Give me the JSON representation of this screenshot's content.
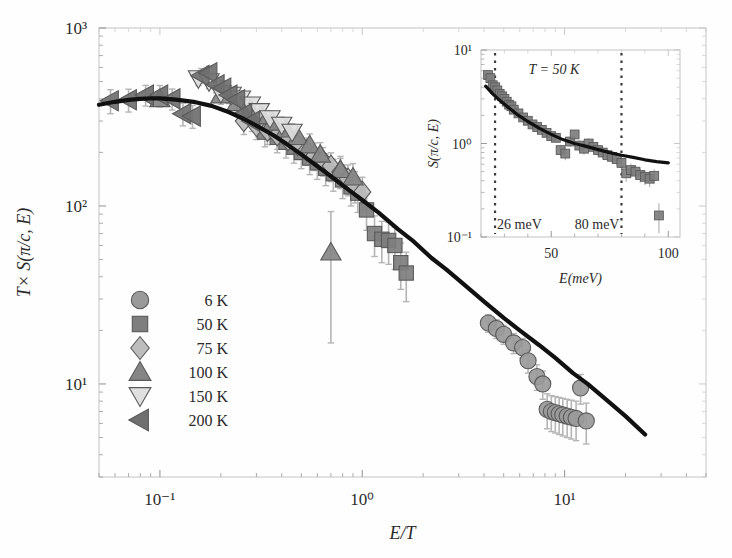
{
  "figure": {
    "background": "#fefefe",
    "frame_color": "#c8c8c8",
    "curve_color": "#111111",
    "marker_fill": "#8f8f8f",
    "marker_edge": "#5a5a5a",
    "marker_fill_light": "#cfcfcf",
    "errorbar_color": "#b5b5b5"
  },
  "chart_data": {
    "type": "scatter",
    "title": "",
    "xlabel": "E/T",
    "ylabel": "T× S(π/c, E)",
    "xscale": "log",
    "yscale": "log",
    "xlim": [
      0.05,
      50
    ],
    "ylim": [
      3,
      1000
    ],
    "xticks": [
      0.1,
      1,
      10
    ],
    "xticklabels": [
      "10⁻¹",
      "10⁰",
      "10¹"
    ],
    "yticks": [
      10,
      100,
      1000
    ],
    "yticklabels": [
      "10¹",
      "10²",
      "10³"
    ],
    "grid": false,
    "legend_position": "lower-left",
    "legend": [
      {
        "label": "6 K",
        "marker": "circle",
        "fill": "#9a9a9a"
      },
      {
        "label": "50 K",
        "marker": "square",
        "fill": "#7e7e7e"
      },
      {
        "label": "75 K",
        "marker": "diamond",
        "fill": "#bdbdbd"
      },
      {
        "label": "100 K",
        "marker": "triangle-up",
        "fill": "#858585"
      },
      {
        "label": "150 K",
        "marker": "triangle-down",
        "fill": "#e0e0e0"
      },
      {
        "label": "200 K",
        "marker": "triangle-left",
        "fill": "#6f6f6f"
      }
    ],
    "fit_curve": {
      "name": "scaling function fit",
      "x": [
        0.05,
        0.06,
        0.07,
        0.08,
        0.09,
        0.1,
        0.12,
        0.15,
        0.18,
        0.22,
        0.26,
        0.3,
        0.36,
        0.42,
        0.5,
        0.6,
        0.7,
        0.85,
        1.0,
        1.2,
        1.5,
        1.8,
        2.2,
        2.6,
        3.2,
        4.0,
        5.0,
        6.0,
        7.5,
        9.0,
        11.0,
        13.0,
        16.0,
        20.0,
        25.0
      ],
      "y": [
        370,
        385,
        395,
        400,
        402,
        402,
        396,
        383,
        365,
        336,
        308,
        283,
        251,
        224,
        195,
        167,
        147,
        124,
        108,
        92,
        74,
        63,
        51,
        44,
        36,
        29,
        23.5,
        20,
        16.5,
        14,
        11.5,
        10,
        8.2,
        6.6,
        5.2
      ]
    },
    "series": [
      {
        "name": "6 K",
        "marker": "circle",
        "x": [
          4.2,
          4.6,
          5.0,
          5.6,
          6.2,
          6.6,
          7.3,
          7.8,
          8.2,
          8.6,
          9.0,
          9.4,
          9.8,
          10.3,
          10.8,
          11.4,
          12.0,
          12.8
        ],
        "y": [
          22,
          20.5,
          19,
          17,
          16,
          13.5,
          11,
          10,
          7.2,
          7.0,
          6.9,
          6.8,
          6.7,
          6.6,
          6.5,
          6.4,
          9.5,
          6.2
        ],
        "yerr": [
          2.5,
          2.5,
          2.3,
          2.2,
          2.0,
          2.0,
          1.8,
          1.8,
          1.6,
          1.6,
          1.6,
          1.6,
          1.6,
          1.6,
          1.6,
          1.6,
          1.8,
          1.6
        ]
      },
      {
        "name": "50 K",
        "marker": "square",
        "x": [
          0.33,
          0.38,
          0.42,
          0.46,
          0.5,
          0.55,
          0.6,
          0.66,
          0.72,
          0.8,
          0.88,
          0.95,
          1.05,
          1.15,
          1.25,
          1.35,
          1.45,
          1.55,
          1.65
        ],
        "y": [
          260,
          243,
          228,
          214,
          200,
          186,
          175,
          163,
          152,
          140,
          128,
          118,
          95,
          70,
          65,
          64,
          60,
          48,
          42
        ],
        "yerr": [
          45,
          44,
          42,
          40,
          38,
          36,
          34,
          33,
          31,
          30,
          28,
          26,
          22,
          18,
          17,
          17,
          16,
          14,
          13
        ]
      },
      {
        "name": "75 K",
        "marker": "diamond",
        "x": [
          0.26,
          0.3,
          0.34,
          0.38,
          0.43,
          0.48,
          0.53,
          0.58,
          0.64,
          0.7,
          0.78,
          0.85,
          0.92,
          1.0
        ],
        "y": [
          300,
          282,
          265,
          250,
          235,
          220,
          205,
          192,
          180,
          168,
          155,
          142,
          130,
          120
        ],
        "yerr": [
          48,
          46,
          44,
          42,
          40,
          38,
          36,
          34,
          33,
          31,
          30,
          28,
          26,
          25
        ]
      },
      {
        "name": "100 K",
        "marker": "triangle-up",
        "x": [
          0.1,
          0.2,
          0.24,
          0.28,
          0.32,
          0.36,
          0.42,
          0.48,
          0.55,
          0.62,
          0.7,
          0.78,
          0.9
        ],
        "y": [
          400,
          420,
          380,
          350,
          320,
          295,
          270,
          245,
          220,
          195,
          55,
          160,
          145
        ],
        "yerr": [
          40,
          48,
          46,
          44,
          42,
          40,
          38,
          36,
          34,
          32,
          38,
          30,
          28
        ]
      },
      {
        "name": "150 K",
        "marker": "triangle-down",
        "x": [
          0.155,
          0.175,
          0.2,
          0.225,
          0.25,
          0.28,
          0.31,
          0.35,
          0.4,
          0.45
        ],
        "y": [
          520,
          500,
          430,
          420,
          400,
          370,
          340,
          310,
          285,
          260
        ],
        "yerr": [
          45,
          44,
          42,
          40,
          38,
          36,
          34,
          33,
          31,
          30
        ]
      },
      {
        "name": "200 K",
        "marker": "triangle-left",
        "x": [
          0.057,
          0.07,
          0.085,
          0.1,
          0.115,
          0.13,
          0.145,
          0.16,
          0.175,
          0.19,
          0.205,
          0.22,
          0.24,
          0.26,
          0.285
        ],
        "y": [
          390,
          395,
          420,
          420,
          400,
          330,
          320,
          540,
          560,
          480,
          460,
          420,
          395,
          330,
          300
        ],
        "yerr": [
          60,
          58,
          56,
          55,
          54,
          48,
          47,
          52,
          50,
          48,
          46,
          44,
          42,
          40,
          38
        ]
      }
    ]
  },
  "inset": {
    "annotation": "T = 50 K",
    "xlabel": "E(meV)",
    "ylabel": "S(π/c, E)",
    "xscale": "linear",
    "yscale": "log",
    "xlim": [
      20,
      105
    ],
    "ylim": [
      0.1,
      10
    ],
    "xticks": [
      50,
      100
    ],
    "xticklabels": [
      "50",
      "100"
    ],
    "yticks": [
      0.1,
      1,
      10
    ],
    "yticklabels": [
      "10⁻¹",
      "10⁰",
      "10¹"
    ],
    "vlines": [
      {
        "x": 26,
        "label": "26 meV"
      },
      {
        "x": 80,
        "label": "80 meV"
      }
    ],
    "chart_data": {
      "type": "scatter",
      "series": [
        {
          "name": "50 K",
          "marker": "square",
          "x": [
            23,
            24,
            25,
            26,
            27,
            28,
            29,
            30,
            31,
            32,
            33,
            34,
            36,
            38,
            40,
            42,
            44,
            46,
            48,
            50,
            52,
            54,
            56,
            58,
            60,
            62,
            64,
            66,
            68,
            70,
            72,
            74,
            76,
            78,
            80,
            82,
            84,
            86,
            88,
            90,
            92,
            94,
            96
          ],
          "y": [
            5.4,
            5.0,
            4.2,
            4.0,
            3.7,
            3.4,
            3.2,
            3.0,
            2.8,
            2.6,
            2.5,
            2.3,
            2.1,
            1.9,
            1.75,
            1.6,
            1.5,
            1.4,
            1.3,
            1.2,
            1.15,
            0.85,
            0.78,
            1.05,
            1.25,
            0.95,
            0.88,
            1.0,
            0.92,
            0.85,
            0.8,
            0.75,
            0.72,
            0.68,
            0.62,
            0.48,
            0.52,
            0.5,
            0.46,
            0.44,
            0.42,
            0.45,
            0.17
          ],
          "yerr": [
            0.5,
            0.45,
            0.4,
            0.38,
            0.35,
            0.33,
            0.3,
            0.28,
            0.26,
            0.25,
            0.23,
            0.22,
            0.2,
            0.19,
            0.18,
            0.17,
            0.16,
            0.15,
            0.14,
            0.13,
            0.13,
            0.12,
            0.12,
            0.13,
            0.14,
            0.13,
            0.12,
            0.13,
            0.12,
            0.12,
            0.11,
            0.11,
            0.1,
            0.1,
            0.1,
            0.09,
            0.09,
            0.09,
            0.08,
            0.08,
            0.08,
            0.08,
            0.06
          ]
        }
      ],
      "fit_curve": {
        "x": [
          22,
          25,
          28,
          32,
          36,
          40,
          45,
          50,
          55,
          60,
          65,
          70,
          75,
          80,
          85,
          90,
          95,
          100
        ],
        "y": [
          4.1,
          3.4,
          2.9,
          2.4,
          2.0,
          1.72,
          1.45,
          1.25,
          1.1,
          1.0,
          0.93,
          0.86,
          0.8,
          0.75,
          0.71,
          0.67,
          0.64,
          0.62
        ]
      }
    }
  }
}
